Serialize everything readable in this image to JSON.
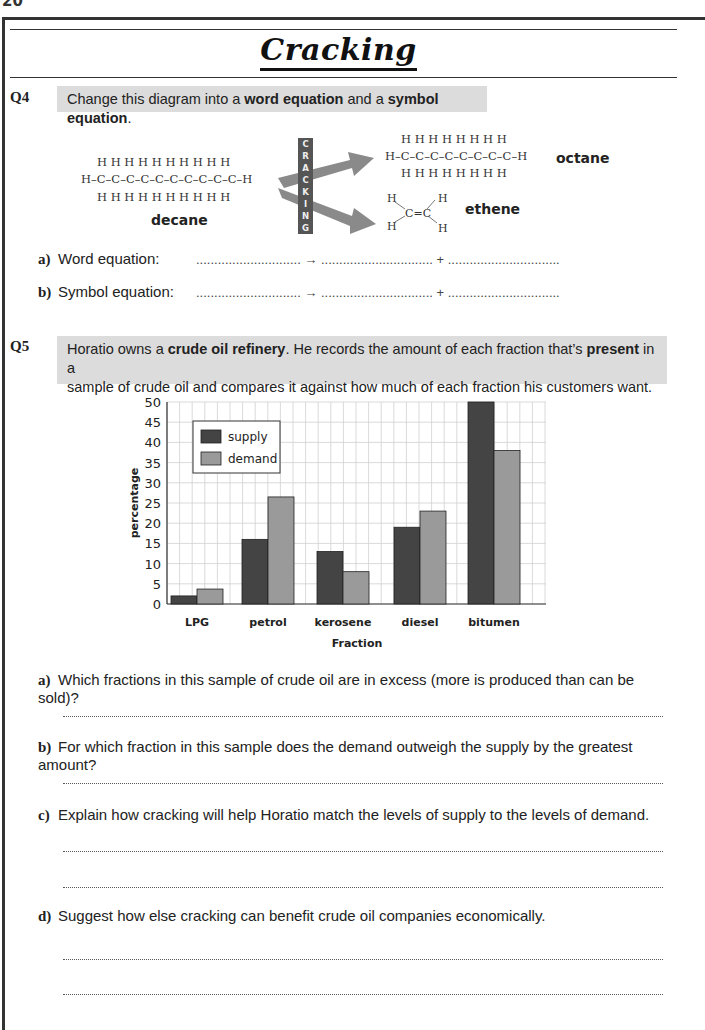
{
  "page": {
    "number": "20",
    "title": "Cracking"
  },
  "q4": {
    "number": "Q4",
    "prompt_parts": [
      "Change this diagram into a ",
      "word equation",
      " and a ",
      "symbol equation",
      "."
    ],
    "diagram": {
      "reactant": {
        "name": "decane",
        "top": "H H H H H H H H H H",
        "middle": "H–C–C–C–C–C–C–C–C–C–C–H",
        "bottom": "H H H H H H H H H H"
      },
      "process_label": "CRACKING",
      "process_letters": [
        "C",
        "R",
        "A",
        "C",
        "K",
        "I",
        "N",
        "G"
      ],
      "product1": {
        "name": "octane",
        "top": "H H H H H H H H",
        "middle": "H–C–C–C–C–C–C–C–C–H",
        "bottom": "H H H H H H H H"
      },
      "product2": {
        "name": "ethene",
        "formula_text": "C=C"
      }
    },
    "parts": [
      {
        "label": "a)",
        "text": "Word equation:",
        "blank": "............................. → ............................... + ..............................."
      },
      {
        "label": "b)",
        "text": "Symbol equation:",
        "blank": "............................. → ............................... + ..............................."
      }
    ]
  },
  "q5": {
    "number": "Q5",
    "prompt_line1_parts": [
      "Horatio owns a ",
      "crude oil refinery",
      ".  He records the amount of each fraction that’s ",
      "present",
      " in a"
    ],
    "prompt_line2": "sample of crude oil and compares it against how much of each fraction his customers want.",
    "parts": [
      {
        "label": "a)",
        "text": "Which fractions in this sample of crude oil are in excess (more is produced than can be sold)?"
      },
      {
        "label": "b)",
        "text": "For which fraction in this sample does the demand outweigh the supply by the greatest amount?"
      },
      {
        "label": "c)",
        "text": "Explain how cracking will help Horatio match the levels of supply to the levels of demand."
      },
      {
        "label": "d)",
        "text": "Suggest how else cracking can benefit crude oil companies economically."
      }
    ]
  },
  "colors": {
    "supply": "#444444",
    "demand": "#9a9a9a",
    "question_box": "#dcdcdc",
    "grid": "#d0d0d0"
  },
  "chart_data": {
    "type": "bar",
    "title": "",
    "xlabel": "Fraction",
    "ylabel": "percentage",
    "categories": [
      "LPG",
      "petrol",
      "kerosene",
      "diesel",
      "bitumen"
    ],
    "series": [
      {
        "name": "supply",
        "values": [
          2,
          16,
          13,
          19,
          50
        ]
      },
      {
        "name": "demand",
        "values": [
          3.7,
          26.5,
          8,
          23,
          38
        ]
      }
    ],
    "yticks": [
      0,
      5,
      10,
      15,
      20,
      25,
      30,
      35,
      40,
      45,
      50
    ],
    "ylim": [
      0,
      50
    ],
    "grid": true,
    "legend_position": "upper left"
  }
}
